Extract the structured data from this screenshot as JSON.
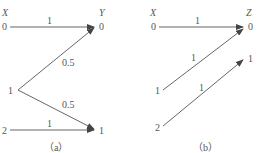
{
  "diagrams": [
    {
      "caption": "（a）",
      "input_label": "X",
      "output_label": "Y",
      "inputs": [
        "0",
        "1",
        "2"
      ],
      "outputs": [
        "0",
        "1"
      ],
      "edges": [
        {
          "from": "0",
          "to": "0",
          "prob": "1"
        },
        {
          "from": "1",
          "to": "0",
          "prob": "0.5"
        },
        {
          "from": "1",
          "to": "1",
          "prob": "0.5"
        },
        {
          "from": "2",
          "to": "1",
          "prob": "1"
        }
      ]
    },
    {
      "caption": "（b）",
      "input_label": "X",
      "output_label": "Z",
      "inputs": [
        "0",
        "1",
        "2"
      ],
      "outputs": [
        "0",
        "1"
      ],
      "edges": [
        {
          "from": "0",
          "to": "0",
          "prob": "1"
        },
        {
          "from": "1",
          "to": "0",
          "prob": "1"
        },
        {
          "from": "2",
          "to": "1",
          "prob": "1"
        }
      ]
    }
  ]
}
